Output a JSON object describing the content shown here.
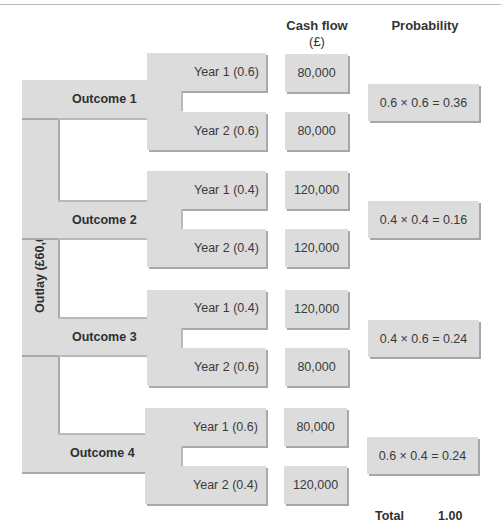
{
  "headers": {
    "cash_flow": "Cash flow",
    "cash_flow_unit": "(£)",
    "probability": "Probability"
  },
  "outlay_label": "Outlay (£60,000)",
  "outcomes": [
    {
      "label": "Outcome 1",
      "years": [
        {
          "label": "Year 1 (0.6)",
          "cash_flow": "80,000"
        },
        {
          "label": "Year 2 (0.6)",
          "cash_flow": "80,000"
        }
      ],
      "probability": "0.6 × 0.6 = 0.36"
    },
    {
      "label": "Outcome 2",
      "years": [
        {
          "label": "Year 1 (0.4)",
          "cash_flow": "120,000"
        },
        {
          "label": "Year 2 (0.4)",
          "cash_flow": "120,000"
        }
      ],
      "probability": "0.4 × 0.4 = 0.16"
    },
    {
      "label": "Outcome 3",
      "years": [
        {
          "label": "Year 1 (0.4)",
          "cash_flow": "120,000"
        },
        {
          "label": "Year 2 (0.6)",
          "cash_flow": "80,000"
        }
      ],
      "probability": "0.4 × 0.6 = 0.24"
    },
    {
      "label": "Outcome 4",
      "years": [
        {
          "label": "Year 1 (0.6)",
          "cash_flow": "80,000"
        },
        {
          "label": "Year 2 (0.4)",
          "cash_flow": "120,000"
        }
      ],
      "probability": "0.6 × 0.4 = 0.24"
    }
  ],
  "total": {
    "label": "Total",
    "value": "1.00"
  }
}
